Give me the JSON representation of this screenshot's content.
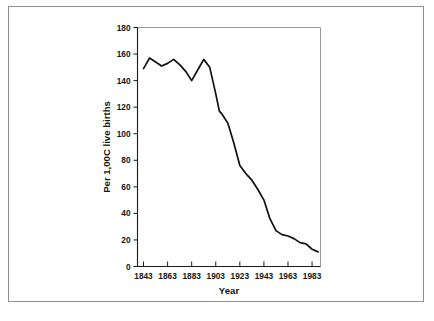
{
  "figure": {
    "caption_partial": "",
    "border_color": "#8d8d8d",
    "background_color": "#ffffff"
  },
  "chart_data": {
    "type": "line",
    "title": "",
    "xlabel": "Year",
    "ylabel": "Per 1,00C live births",
    "xlim": [
      1838,
      1990
    ],
    "ylim": [
      0,
      180
    ],
    "xticks": [
      1843,
      1863,
      1883,
      1903,
      1923,
      1943,
      1963,
      1983
    ],
    "xtick_labels": [
      "1843",
      "1863",
      "1883",
      "1903",
      "1923",
      "1943",
      "1963",
      "1983"
    ],
    "yticks": [
      0,
      20,
      40,
      60,
      80,
      100,
      120,
      140,
      160,
      180
    ],
    "ytick_labels": [
      "0",
      "20",
      "40",
      "60",
      "80",
      "100",
      "120",
      "140",
      "160",
      "180"
    ],
    "grid": false,
    "legend": null,
    "line_color": "#111111",
    "series": [
      {
        "name": "Infant mortality rate",
        "x": [
          1843,
          1848,
          1853,
          1858,
          1863,
          1868,
          1873,
          1878,
          1883,
          1888,
          1893,
          1898,
          1903,
          1906,
          1908,
          1913,
          1918,
          1923,
          1928,
          1933,
          1938,
          1943,
          1948,
          1953,
          1958,
          1963,
          1968,
          1973,
          1978,
          1983,
          1988
        ],
        "values": [
          149,
          157,
          154,
          151,
          153,
          156,
          152,
          147,
          140,
          148,
          156,
          150,
          130,
          117,
          115,
          108,
          93,
          76,
          70,
          65,
          58,
          50,
          36,
          27,
          24,
          23,
          21,
          18,
          17,
          13,
          11
        ]
      }
    ]
  },
  "axis": {
    "x_title": "Year",
    "y_title": "Per 1,00C live births"
  }
}
